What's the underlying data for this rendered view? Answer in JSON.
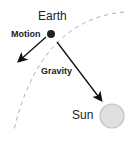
{
  "labels": {
    "earth": "Earth",
    "motion": "Motion",
    "gravity": "Gravity",
    "sun": "Sun"
  },
  "colors": {
    "orbit": "#aaaaaa",
    "arrow": "#111111",
    "earth": "#222222",
    "sun_fill": "#e0e0e0",
    "sun_stroke": "#c4c4c4"
  }
}
